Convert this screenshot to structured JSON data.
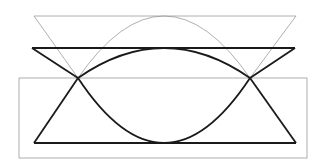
{
  "diagram": {
    "colors": {
      "thin_stroke": "#9a9a9a",
      "thick_stroke": "#1a1a1a",
      "frame_stroke": "#9a9a9a",
      "background": "#ffffff"
    },
    "shapes": [
      {
        "id": "upper-gray-figure",
        "style": "thin",
        "kind": "inverted triangle with arc"
      },
      {
        "id": "middle-black-figure",
        "style": "thick",
        "kind": "inverted triangle with arc"
      },
      {
        "id": "lower-black-figure",
        "style": "thick",
        "kind": "triangle with inverted arc"
      },
      {
        "id": "gray-frame",
        "style": "thin",
        "kind": "rectangle"
      }
    ],
    "labels": []
  }
}
